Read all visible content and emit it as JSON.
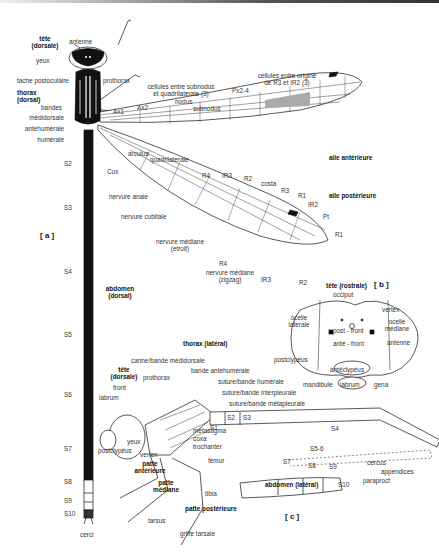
{
  "figure": {
    "panels": [
      "[ a ]",
      "[ b ]",
      "[ c ]"
    ],
    "dorsal": {
      "tete": "tête",
      "tete_sub": "(dorsale)",
      "antenne": "antenne",
      "yeux": "yeux",
      "tache": "tache postoculaire",
      "thorax": "thorax",
      "thorax_sub": "(dorsal)",
      "prothorax": "prothorax",
      "bandes": "bandes",
      "medidorsale": "médidorsale",
      "antehumerale": "antehumérale",
      "humerale": "humérale",
      "abdomen": "abdomen",
      "abdomen_sub": "(dorsal)",
      "segments": [
        "S2",
        "S3",
        "S4",
        "S5",
        "S6",
        "S7",
        "S8",
        "S9",
        "S10"
      ],
      "cerci": "cerci"
    },
    "wings": {
      "cellules1": "cellules entre subnodus",
      "cellules1b": "et quadrilaterale (3)",
      "cellules2": "cellules entre origine",
      "cellules2b": "de R3 et IR2 (3)",
      "nodus": "nodus",
      "subnodus": "subnodus",
      "px": "Px2-4",
      "ax1": "Ax1",
      "ax2": "Ax2",
      "arculus": "arculus",
      "quadrilaterale": "quadrilaterale",
      "aile_ant": "aile antérieure",
      "aile_post": "aile postérieure",
      "cux": "Cux",
      "anale": "nervure anale",
      "cubitale": "nervure cubitale",
      "mediane1": "nervure médiane",
      "mediane1b": "(etroit)",
      "mediane2": "nervure médiane",
      "mediane2b": "(zigzag)",
      "r4_top": "R4",
      "ir3_top": "IR3",
      "r2_top": "R2",
      "costa": "costa",
      "r3": "R3",
      "r1_top": "R1",
      "ir2": "IR2",
      "pt": "Pt",
      "r1_tip": "R1",
      "r4_bottom": "R4",
      "ir3_bottom": "IR3",
      "r2_bottom": "R2"
    },
    "head_rostral": {
      "title": "tête (rostrale)",
      "occiput": "occiput",
      "vertex": "vertex",
      "ocelle_lat": "ocelle",
      "ocelle_lat_b": "laterale",
      "ocelle_med": "ocelle",
      "ocelle_med_b": "médiane",
      "post_front": "post - front",
      "ante_front": "anté - front",
      "antenne": "antenne",
      "postclypeus": "postclypéus",
      "anteclypeus": "antéclypéus",
      "mandibule": "mandibule",
      "labrum": "labrum",
      "gena": "gena"
    },
    "lateral": {
      "thorax": "thorax (latéral)",
      "carine": "carine/bande médidorsale",
      "tete": "tête",
      "tete_sub": "(dorsale)",
      "prothorax": "prothorax",
      "bande_ant": "bande antehumérale",
      "suture_hum": "suture/bande humérale",
      "suture_inter": "suture/bande interpleurale",
      "suture_meta": "suture/bande métapleurale",
      "front": "front",
      "labrum": "labrum",
      "yeux": "yeux",
      "postclypeus": "postclypéus",
      "vertex": "vertex",
      "metastigma": "métastigma",
      "coxa": "coxa",
      "trochanter": "trochanter",
      "femur": "fémur",
      "tibia": "tibia",
      "tarsus": "tarsus",
      "griffe": "griffe tarsale",
      "patte_ant": "patte",
      "patte_ant_b": "antérieure",
      "patte_med": "patte",
      "patte_med_b": "médiane",
      "patte_post": "patte postérieure",
      "s1": "S1",
      "s2": "S2",
      "s3": "S3",
      "s4": "S4",
      "s56": "S5-6",
      "s7": "S7",
      "s8": "S8",
      "s9": "S9",
      "s10": "S10",
      "cercus": "cercus",
      "paraproct": "paraproct",
      "appendices": "appendices",
      "abdomen": "abdomen (latéral)",
      "mesepimeron": "mesepimeron"
    }
  }
}
